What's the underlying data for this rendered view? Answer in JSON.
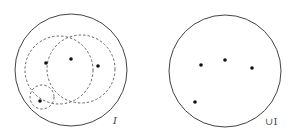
{
  "colors": {
    "stroke": "#444444",
    "dashed_stroke": "#555555",
    "point": "#111111",
    "background": "#ffffff"
  },
  "left_panel": {
    "label": "I",
    "outer_circle": {
      "cx": 71,
      "cy": 70,
      "r": 56
    },
    "dashed_circles": [
      {
        "cx": 59,
        "cy": 70,
        "r": 34
      },
      {
        "cx": 81,
        "cy": 69,
        "r": 34
      },
      {
        "cx": 42,
        "cy": 97,
        "r": 12
      }
    ],
    "points": [
      {
        "x": 46,
        "y": 63
      },
      {
        "x": 71,
        "y": 59
      },
      {
        "x": 98,
        "y": 66
      },
      {
        "x": 40,
        "y": 101
      }
    ]
  },
  "right_panel": {
    "label": "∪I",
    "outer_circle": {
      "cx": 225,
      "cy": 71,
      "r": 56
    },
    "points": [
      {
        "x": 201,
        "y": 65
      },
      {
        "x": 225,
        "y": 60
      },
      {
        "x": 252,
        "y": 68
      },
      {
        "x": 195,
        "y": 102
      }
    ]
  }
}
